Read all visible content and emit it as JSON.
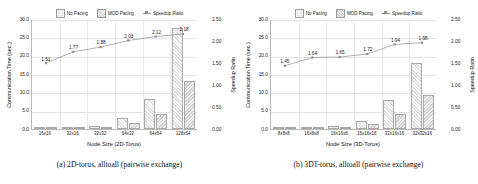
{
  "legend": {
    "items": [
      {
        "label": "No Pacing",
        "kind": "bar-nopacing"
      },
      {
        "label": "MOD Pacing",
        "kind": "bar-modpacing"
      },
      {
        "label": "Speedup Ratio",
        "kind": "line-marker"
      }
    ]
  },
  "panels": [
    {
      "caption": "(a) 2D-torus, alltoall (pairwise exchange)",
      "chart_data": {
        "type": "bar",
        "title": "",
        "categories": [
          "16x16",
          "32x16",
          "32x32",
          "64x32",
          "64x64",
          "128x64"
        ],
        "xlabel": "Node Size (2D-Torus)",
        "ylabel": "Communication Time (sec.)",
        "ylim": [
          0.0,
          30.0
        ],
        "yticks": [
          "0.0",
          "5.0",
          "10.0",
          "15.0",
          "20.0",
          "25.0",
          "30.0"
        ],
        "y2label": "Speedup Ratio",
        "y2lim": [
          0.0,
          2.5
        ],
        "y2ticks": [
          "0.00",
          "0.50",
          "1.00",
          "1.50",
          "2.00",
          "2.50"
        ],
        "grid": true,
        "legend_position": "top",
        "series": [
          {
            "name": "No Pacing",
            "axis": "left",
            "values": [
              0.18,
              0.35,
              0.9,
              3.1,
              8.1,
              27.5
            ]
          },
          {
            "name": "MOD Pacing",
            "axis": "left",
            "values": [
              0.12,
              0.2,
              0.5,
              1.6,
              4.0,
              13.0
            ]
          },
          {
            "name": "Speedup Ratio",
            "axis": "right",
            "values": [
              1.51,
              1.77,
              1.88,
              2.03,
              2.12,
              2.18
            ]
          }
        ],
        "annotations": [
          "1.51",
          "1.77",
          "1.88",
          "2.03",
          "2.12",
          "2.18"
        ]
      }
    },
    {
      "caption": "(b) 3DT-torus, alltoall (pairwise exchange)",
      "chart_data": {
        "type": "bar",
        "title": "",
        "categories": [
          "8x8x8",
          "16x8x8",
          "16x16x8",
          "16x16x16",
          "32x16x16",
          "32x32x16"
        ],
        "xlabel": "Node Size (3D-Torus)",
        "ylabel": "Communication Time (sec.)",
        "ylim": [
          0.0,
          30.0
        ],
        "yticks": [
          "0.0",
          "5.0",
          "10.0",
          "15.0",
          "20.0",
          "25.0",
          "30.0"
        ],
        "y2label": "Speedup Ratio",
        "y2lim": [
          0.0,
          2.5
        ],
        "y2ticks": [
          "0.00",
          "0.50",
          "1.00",
          "1.50",
          "2.00",
          "2.50"
        ],
        "grid": true,
        "legend_position": "top",
        "series": [
          {
            "name": "No Pacing",
            "axis": "left",
            "values": [
              0.1,
              0.3,
              0.7,
              2.3,
              7.8,
              18.0
            ]
          },
          {
            "name": "MOD Pacing",
            "axis": "left",
            "values": [
              0.07,
              0.18,
              0.4,
              1.3,
              4.1,
              9.2
            ]
          },
          {
            "name": "Speedup Ratio",
            "axis": "right",
            "values": [
              1.45,
              1.64,
              1.65,
              1.72,
              1.94,
              1.98
            ]
          }
        ],
        "annotations": [
          "1.45",
          "1.64",
          "1.65",
          "1.72",
          "1.94",
          "1.98"
        ]
      }
    }
  ]
}
